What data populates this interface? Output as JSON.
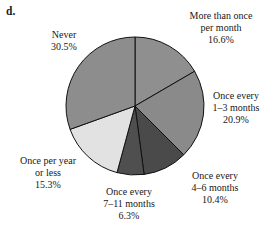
{
  "figure": {
    "part_letter": "d.",
    "center_x": 135,
    "center_y": 106,
    "radius": 69
  },
  "chart_data": {
    "type": "pie",
    "title": "",
    "xlabel": "",
    "ylabel": "",
    "legend_position": "none",
    "grid": false,
    "start_angle_deg": 0,
    "direction": "clockwise",
    "categories": [
      "More than once per month",
      "Once every 1–3 months",
      "Once every 4–6 months",
      "Once every 7–11 months",
      "Once per year or less",
      "Never"
    ],
    "values": [
      16.6,
      20.9,
      10.4,
      6.3,
      15.3,
      30.5
    ],
    "value_unit": "%",
    "colors": [
      "#8f8f8f",
      "#8a8a8a",
      "#4a4a4a",
      "#4f4f4f",
      "#e2e2e2",
      "#8d8d8d"
    ],
    "slices": [
      {
        "name": "More than once per month",
        "value": 16.6,
        "value_label": "16.6%",
        "color": "#8f8f8f",
        "label_lines": [
          "More than once",
          "per month",
          "16.6%"
        ]
      },
      {
        "name": "Once every 1–3 months",
        "value": 20.9,
        "value_label": "20.9%",
        "color": "#8a8a8a",
        "label_lines": [
          "Once every",
          "1–3 months",
          "20.9%"
        ]
      },
      {
        "name": "Once every 4–6 months",
        "value": 10.4,
        "value_label": "10.4%",
        "color": "#4a4a4a",
        "label_lines": [
          "Once every",
          "4–6 months",
          "10.4%"
        ]
      },
      {
        "name": "Once every 7–11 months",
        "value": 6.3,
        "value_label": "6.3%",
        "color": "#4f4f4f",
        "label_lines": [
          "Once every",
          "7–11 months",
          "6.3%"
        ]
      },
      {
        "name": "Once per year or less",
        "value": 15.3,
        "value_label": "15.3%",
        "color": "#e2e2e2",
        "label_lines": [
          "Once per year",
          "or less",
          "15.3%"
        ]
      },
      {
        "name": "Never",
        "value": 30.5,
        "value_label": "30.5%",
        "color": "#8d8d8d",
        "label_lines": [
          "Never",
          "30.5%"
        ]
      }
    ]
  }
}
